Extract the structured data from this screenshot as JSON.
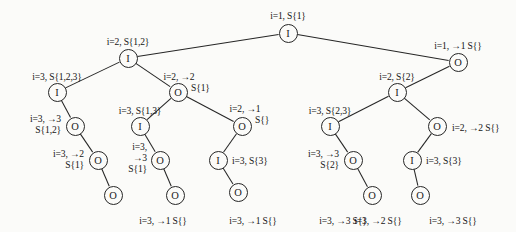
{
  "figure": {
    "node_glyphs": {
      "internal": "I",
      "output": "O"
    },
    "canvas": {
      "width": 516,
      "height": 232
    }
  },
  "nodes": [
    {
      "id": "n0",
      "glyph": "I",
      "x": 288,
      "y": 33
    },
    {
      "id": "n1",
      "glyph": "I",
      "x": 128,
      "y": 58
    },
    {
      "id": "n2",
      "glyph": "O",
      "x": 458,
      "y": 62
    },
    {
      "id": "n3",
      "glyph": "I",
      "x": 57,
      "y": 92
    },
    {
      "id": "n4",
      "glyph": "O",
      "x": 178,
      "y": 92
    },
    {
      "id": "n5",
      "glyph": "I",
      "x": 397,
      "y": 92
    },
    {
      "id": "n6",
      "glyph": "O",
      "x": 75,
      "y": 126
    },
    {
      "id": "n7",
      "glyph": "I",
      "x": 140,
      "y": 126
    },
    {
      "id": "n8",
      "glyph": "O",
      "x": 242,
      "y": 126
    },
    {
      "id": "n9",
      "glyph": "I",
      "x": 330,
      "y": 126
    },
    {
      "id": "n10",
      "glyph": "O",
      "x": 437,
      "y": 126
    },
    {
      "id": "n11",
      "glyph": "O",
      "x": 98,
      "y": 160
    },
    {
      "id": "n12",
      "glyph": "O",
      "x": 160,
      "y": 160
    },
    {
      "id": "n13",
      "glyph": "I",
      "x": 218,
      "y": 160
    },
    {
      "id": "n14",
      "glyph": "O",
      "x": 353,
      "y": 160
    },
    {
      "id": "n15",
      "glyph": "I",
      "x": 412,
      "y": 160
    },
    {
      "id": "n16",
      "glyph": "O",
      "x": 113,
      "y": 195
    },
    {
      "id": "n17",
      "glyph": "O",
      "x": 175,
      "y": 195
    },
    {
      "id": "n18",
      "glyph": "O",
      "x": 238,
      "y": 192
    },
    {
      "id": "n19",
      "glyph": "O",
      "x": 372,
      "y": 195
    },
    {
      "id": "n20",
      "glyph": "O",
      "x": 420,
      "y": 195
    }
  ],
  "edges": [
    {
      "from": "n0",
      "to": "n1"
    },
    {
      "from": "n0",
      "to": "n2"
    },
    {
      "from": "n1",
      "to": "n3"
    },
    {
      "from": "n1",
      "to": "n4"
    },
    {
      "from": "n2",
      "to": "n5"
    },
    {
      "from": "n3",
      "to": "n6"
    },
    {
      "from": "n4",
      "to": "n7"
    },
    {
      "from": "n4",
      "to": "n8"
    },
    {
      "from": "n5",
      "to": "n9"
    },
    {
      "from": "n5",
      "to": "n10"
    },
    {
      "from": "n6",
      "to": "n11"
    },
    {
      "from": "n7",
      "to": "n12"
    },
    {
      "from": "n8",
      "to": "n13"
    },
    {
      "from": "n9",
      "to": "n14"
    },
    {
      "from": "n10",
      "to": "n15"
    },
    {
      "from": "n11",
      "to": "n16"
    },
    {
      "from": "n12",
      "to": "n17"
    },
    {
      "from": "n13",
      "to": "n18"
    },
    {
      "from": "n14",
      "to": "n19"
    },
    {
      "from": "n15",
      "to": "n20"
    }
  ],
  "labels": [
    {
      "id": "l0",
      "text": "i=1, S{1}",
      "x": 288,
      "y": 10,
      "align": "center"
    },
    {
      "id": "l1",
      "text": "i=2, S{1,2}",
      "x": 128,
      "y": 36,
      "align": "center"
    },
    {
      "id": "l2",
      "text": "i=1, →1 S{}",
      "x": 458,
      "y": 40,
      "align": "center"
    },
    {
      "id": "l3",
      "text": "i=3, S{1,2,3}",
      "x": 57,
      "y": 71,
      "align": "center"
    },
    {
      "id": "l4",
      "text": "i=2, →2",
      "x": 179,
      "y": 71,
      "align": "center"
    },
    {
      "id": "l5",
      "text": "S{1}",
      "x": 191,
      "y": 82,
      "align": "left"
    },
    {
      "id": "l6",
      "text": "i=2, S{2}",
      "x": 397,
      "y": 71,
      "align": "center"
    },
    {
      "id": "l7",
      "text": "i=3, →3",
      "x": 61,
      "y": 113,
      "align": "right"
    },
    {
      "id": "l8",
      "text": "S{1,2}",
      "x": 61,
      "y": 124,
      "align": "right"
    },
    {
      "id": "l9",
      "text": "i=3, S{1,3}",
      "x": 140,
      "y": 105,
      "align": "center"
    },
    {
      "id": "l10",
      "text": "i=2, →1",
      "x": 245,
      "y": 103,
      "align": "center"
    },
    {
      "id": "l11",
      "text": "S{}",
      "x": 255,
      "y": 114,
      "align": "left"
    },
    {
      "id": "l12",
      "text": "i=3, S{2,3}",
      "x": 330,
      "y": 105,
      "align": "center"
    },
    {
      "id": "l13",
      "text": "i=2, →2 S{}",
      "x": 452,
      "y": 122,
      "align": "left"
    },
    {
      "id": "l14",
      "text": "i=3, →2",
      "x": 84,
      "y": 148,
      "align": "right"
    },
    {
      "id": "l15",
      "text": "S{1}",
      "x": 84,
      "y": 159,
      "align": "right"
    },
    {
      "id": "l16",
      "text": "i=3,",
      "x": 147,
      "y": 141,
      "align": "right"
    },
    {
      "id": "l17",
      "text": "→3",
      "x": 147,
      "y": 152,
      "align": "right"
    },
    {
      "id": "l18",
      "text": "S{1}",
      "x": 147,
      "y": 163,
      "align": "right"
    },
    {
      "id": "l19",
      "text": "i=3, S{3}",
      "x": 232,
      "y": 155,
      "align": "left"
    },
    {
      "id": "l20",
      "text": "i=3, →3",
      "x": 339,
      "y": 148,
      "align": "right"
    },
    {
      "id": "l21",
      "text": "S{2}",
      "x": 339,
      "y": 159,
      "align": "right"
    },
    {
      "id": "l22",
      "text": "i=3, S{3}",
      "x": 426,
      "y": 155,
      "align": "left"
    },
    {
      "id": "l23",
      "text": "i=3, →1 S{}",
      "x": 163,
      "y": 215,
      "align": "center"
    },
    {
      "id": "l24",
      "text": "i=3, →1 S{}",
      "x": 253,
      "y": 215,
      "align": "center"
    },
    {
      "id": "l25",
      "text": "i=3, →3 S{}",
      "x": 343,
      "y": 215,
      "align": "center"
    },
    {
      "id": "l26",
      "text": "i=3, →2 S{}",
      "x": 378,
      "y": 215,
      "align": "center"
    },
    {
      "id": "l27",
      "text": "i=3, →3 S{}",
      "x": 453,
      "y": 215,
      "align": "center"
    }
  ]
}
